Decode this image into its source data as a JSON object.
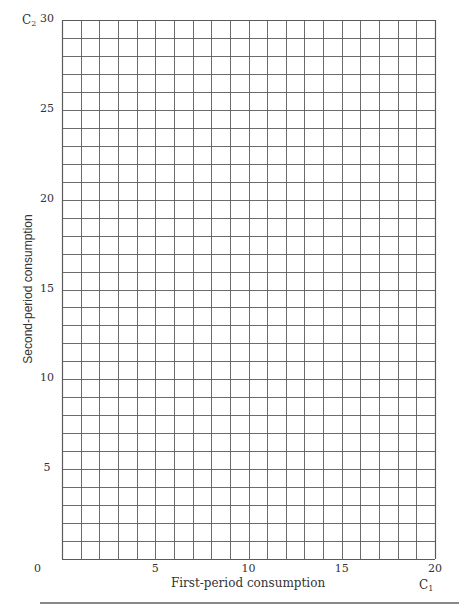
{
  "chart_data": {
    "type": "line",
    "title": "",
    "xlabel": "First-period consumption",
    "ylabel": "Second-period consumption",
    "x_variable": "C1",
    "y_variable": "C2",
    "xlim": [
      0,
      20
    ],
    "ylim": [
      0,
      30
    ],
    "x_ticks": [
      0,
      5,
      10,
      15,
      20
    ],
    "y_ticks": [
      5,
      10,
      15,
      20,
      25,
      30
    ],
    "x_tick_labels": [
      "0",
      "5",
      "10",
      "15",
      "20"
    ],
    "y_tick_labels": [
      "5",
      "10",
      "15",
      "20",
      "25",
      "30"
    ],
    "grid": true,
    "grid_step_x": 1,
    "grid_step_y": 1,
    "series": [],
    "legend": null,
    "note": "Blank graph-paper worksheet; no data plotted"
  },
  "labels": {
    "x_axis_title": "First-period consumption",
    "y_axis_title": "Second-period consumption",
    "x_var_base": "C",
    "x_var_sub": "1",
    "y_var_base": "C",
    "y_var_sub": "2",
    "origin": "0"
  },
  "colors": {
    "grid": "#5a5a5a",
    "text": "#333333",
    "rule": "#888888"
  }
}
